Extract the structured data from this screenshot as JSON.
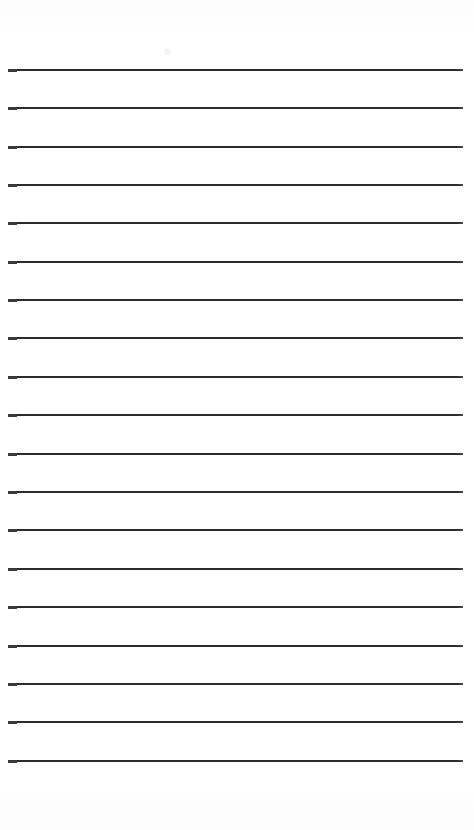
{
  "document": {
    "kind": "scanned-ruled-paper",
    "title": "Blank ruled notepaper page",
    "alt_text": "A scanned blank sheet of ruled writing paper with evenly spaced horizontal lines and no handwriting",
    "page_width": 474,
    "page_height": 830,
    "background_color": "#ffffff",
    "paper_tint_color": "#fdfdfd",
    "content_text": ""
  },
  "ruling": {
    "line_color": "#2b2b2b",
    "line_cap_color": "#3a3a3a",
    "line_thickness": 2,
    "line_count": 19,
    "left_margin": 8,
    "right_margin": 11,
    "line_length": 455,
    "first_line_y": 69,
    "line_spacing": 38.5,
    "top_blank_height": 69,
    "bottom_blank_height": 58,
    "has_vertical_margin_rule": false,
    "has_holes": false,
    "lines_y": [
      69,
      107,
      146,
      184,
      222,
      261,
      299,
      337,
      376,
      414,
      453,
      491,
      529,
      568,
      606,
      645,
      683,
      721,
      760
    ]
  },
  "artifacts": {
    "items": [
      {
        "name": "faint-scanner-speck",
        "x": 164,
        "y": 48
      }
    ]
  }
}
